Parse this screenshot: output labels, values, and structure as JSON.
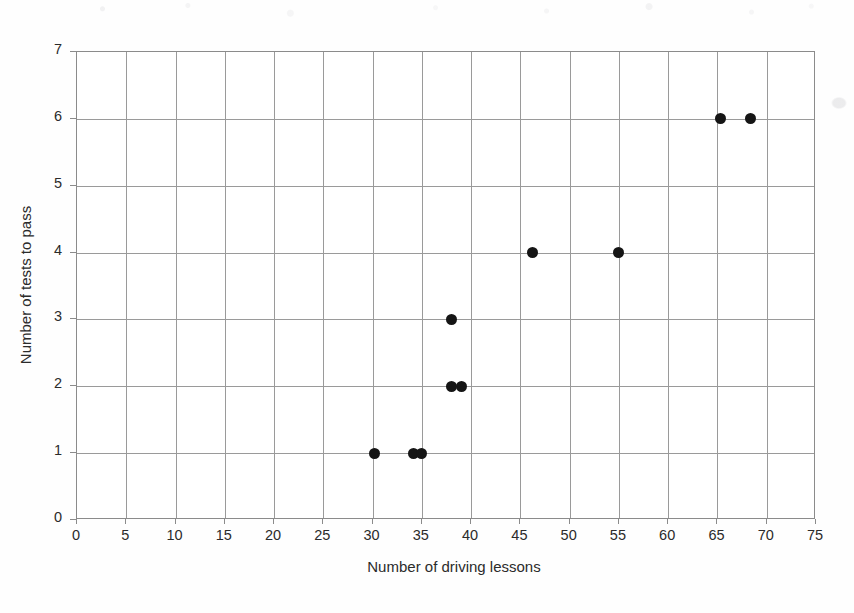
{
  "chart_data": {
    "type": "scatter",
    "title": "",
    "subtitle": "",
    "xlabel": "Number of driving lessons",
    "ylabel": "Number of tests to pass",
    "xlim": [
      0,
      75
    ],
    "ylim": [
      0,
      7
    ],
    "xticks": [
      0,
      5,
      10,
      15,
      20,
      25,
      30,
      35,
      40,
      45,
      50,
      55,
      60,
      65,
      70,
      75
    ],
    "yticks": [
      0,
      1,
      2,
      3,
      4,
      5,
      6,
      7
    ],
    "xtick_labels": [
      "0",
      "5",
      "10",
      "15",
      "20",
      "25",
      "30",
      "35",
      "40",
      "45",
      "50",
      "55",
      "60",
      "65",
      "70",
      "75"
    ],
    "ytick_labels": [
      "0",
      "1",
      "2",
      "3",
      "4",
      "5",
      "6",
      "7"
    ],
    "grid": true,
    "grid_axes": "both",
    "legend": false,
    "legend_position": "none",
    "marker": "filled-circle",
    "marker_color": "#151515",
    "grid_color": "#9a9a9a",
    "frame_color": "#8b8b8b",
    "points": [
      {
        "x": 30.2,
        "y": 1
      },
      {
        "x": 34.2,
        "y": 1
      },
      {
        "x": 35.0,
        "y": 1
      },
      {
        "x": 38.0,
        "y": 2
      },
      {
        "x": 39.0,
        "y": 2
      },
      {
        "x": 38.0,
        "y": 3
      },
      {
        "x": 46.2,
        "y": 4
      },
      {
        "x": 55.0,
        "y": 4
      },
      {
        "x": 65.3,
        "y": 6
      },
      {
        "x": 68.4,
        "y": 6
      }
    ]
  },
  "axis_titles": {
    "x": "Number of driving lessons",
    "y": "Number of tests to pass"
  }
}
